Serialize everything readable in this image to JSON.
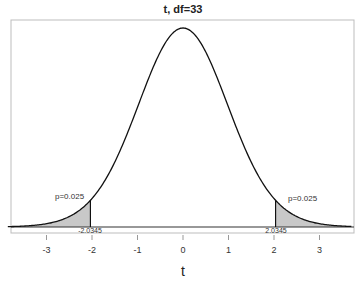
{
  "chart_data": {
    "type": "area",
    "title": "t, df=33",
    "distribution": "Student t",
    "df": 33,
    "xlabel": "t",
    "ylabel": "",
    "xlim": [
      -3.85,
      3.7
    ],
    "ylim": [
      0,
      0.396
    ],
    "x_ticks": [
      -3,
      -2,
      -1,
      0,
      1,
      2,
      3
    ],
    "x_tick_labels": [
      "-3",
      "-2",
      "-1",
      "0",
      "1",
      "2",
      "3"
    ],
    "grid": false,
    "legend": null,
    "critical_values": [
      -2.0345,
      2.0345
    ],
    "critical_value_labels": [
      "-2.0345",
      "2.0345"
    ],
    "shaded_regions": [
      {
        "from": -3.85,
        "to": -2.0345,
        "probability": 0.025,
        "label": "p=0.025"
      },
      {
        "from": 2.0345,
        "to": 3.7,
        "probability": 0.025,
        "label": "p=0.025"
      }
    ],
    "peak_density": 0.3959,
    "colors": {
      "curve": "#111111",
      "shade": "#c8c8c8",
      "frame": "#bdbdbd",
      "baseline": "#333333"
    }
  }
}
